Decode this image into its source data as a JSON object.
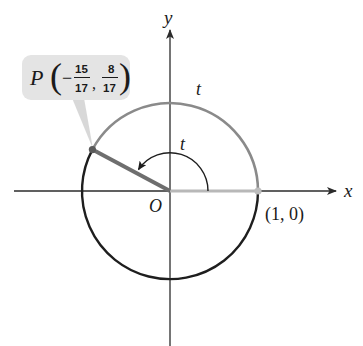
{
  "figure": {
    "colors": {
      "axis": "#2b2b2b",
      "circle_lower": "#1e1e1e",
      "circle_upper_arc": "#8a8a8a",
      "radius_to_P": "#6e6e6e",
      "radius_positive_x": "#b8b8b8",
      "callout_fill": "#e4e4e4",
      "callout_pointer": "#d0d0d0",
      "point_P": "#5a5a5a",
      "point_1_0": "#bdbdbd"
    }
  },
  "axes": {
    "x_label": "x",
    "y_label": "y",
    "origin_label": "O"
  },
  "labels": {
    "arc_t": "t",
    "angle_t": "t",
    "point_1_0": "(1, 0)"
  },
  "point_P": {
    "name": "P",
    "x_sign": "−",
    "x_num": "15",
    "x_den": "17",
    "comma": ",",
    "y_num": "8",
    "y_den": "17",
    "open_paren": "(",
    "close_paren": ")"
  }
}
